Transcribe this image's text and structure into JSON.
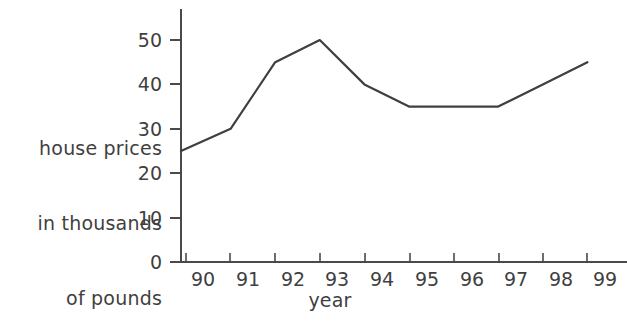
{
  "chart_data": {
    "type": "line",
    "title": "",
    "xlabel": "year",
    "ylabel": "house prices in thousands of pounds",
    "ylabel_lines": [
      "house prices",
      "in thousands",
      "of pounds"
    ],
    "categories": [
      "90",
      "91",
      "92",
      "93",
      "94",
      "95",
      "96",
      "97",
      "98",
      "99"
    ],
    "x": [
      90,
      91,
      92,
      93,
      94,
      95,
      96,
      97,
      98,
      99
    ],
    "values": [
      25,
      30,
      45,
      50,
      40,
      35,
      35,
      35,
      40,
      45
    ],
    "series": [
      {
        "name": "house prices",
        "values": [
          25,
          30,
          45,
          50,
          40,
          35,
          35,
          35,
          40,
          45
        ],
        "color": "#3f3f3f"
      }
    ],
    "yticks": [
      0,
      10,
      20,
      30,
      40,
      50
    ],
    "ytick_labels": [
      "0",
      "10",
      "20",
      "30",
      "40",
      "50"
    ],
    "ylim": [
      0,
      55
    ],
    "xtick_labels": [
      "90",
      "91",
      "92",
      "93",
      "94",
      "95",
      "96",
      "97",
      "98",
      "99"
    ],
    "grid": false,
    "legend": "none",
    "axis_color": "#4a4a4a",
    "line_color": "#3f3f3f",
    "background": "#ffffff"
  }
}
